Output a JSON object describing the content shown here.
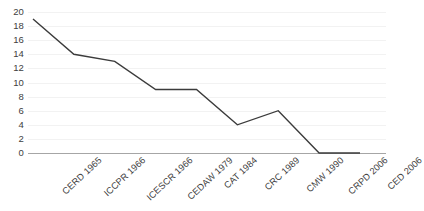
{
  "chart_data": {
    "type": "line",
    "title": "",
    "xlabel": "",
    "ylabel": "",
    "categories": [
      "CERD 1965",
      "ICCPR 1966",
      "ICESCR 1966",
      "CEDAW 1979",
      "CAT 1984",
      "CRC 1989",
      "CMW 1990",
      "CRPD 2006",
      "CED 2006"
    ],
    "values": [
      19,
      14,
      13,
      9,
      9,
      4,
      6,
      0,
      0
    ],
    "ylim": [
      0,
      20
    ],
    "yticks": [
      0,
      2,
      4,
      6,
      8,
      10,
      12,
      14,
      16,
      18,
      20
    ],
    "ytick_labels": [
      "0",
      "2",
      "4",
      "6",
      "8",
      "10",
      "12",
      "14",
      "16",
      "18",
      "20"
    ],
    "grid": true,
    "legend": false,
    "legend_position": "none",
    "series": [
      {
        "name": "values",
        "values": [
          19,
          14,
          13,
          9,
          9,
          4,
          6,
          0,
          0
        ],
        "color": "#3b3b3b",
        "line_width": 1.4,
        "markers": false
      }
    ],
    "axis_color": "#a6a6a6",
    "gridline_color": "#f2f2f2",
    "text_color": "#404040"
  }
}
